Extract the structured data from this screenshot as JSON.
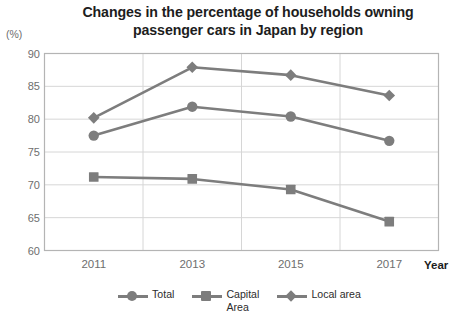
{
  "chart_data": {
    "type": "line",
    "title": "Changes in the percentage of households owning passenger cars in Japan by region",
    "title_line1": "Changes in the percentage of households owning",
    "title_line2": "passenger cars in Japan by region",
    "unit_label": "(%)",
    "xlabel": "Year",
    "ylabel": "",
    "categories": [
      "2011",
      "2013",
      "2015",
      "2017"
    ],
    "x": [
      2011,
      2013,
      2015,
      2017
    ],
    "ylim": [
      60,
      90
    ],
    "yticks": [
      60,
      65,
      70,
      75,
      80,
      85,
      90
    ],
    "ytick_labels": [
      "60",
      "65",
      "70",
      "75",
      "80",
      "85",
      "90"
    ],
    "grid": "horizontal-and-vertical",
    "legend_position": "bottom",
    "series": [
      {
        "name": "Total",
        "legend_label": "Total",
        "marker": "circle",
        "color": "#7d7d7d",
        "values": [
          77.5,
          81.9,
          80.4,
          76.7
        ]
      },
      {
        "name": "Capital Area",
        "legend_label": "Capital\nArea",
        "marker": "square",
        "color": "#7d7d7d",
        "values": [
          71.2,
          70.9,
          69.3,
          64.4
        ]
      },
      {
        "name": "Local area",
        "legend_label": "Local area",
        "marker": "diamond",
        "color": "#7d7d7d",
        "values": [
          80.2,
          87.9,
          86.7,
          83.6
        ]
      }
    ]
  },
  "plot": {
    "frame_color": "#b4b4b4",
    "grid_color": "#d6d6d6",
    "line_color": "#7d7d7d",
    "background": "#ffffff"
  }
}
